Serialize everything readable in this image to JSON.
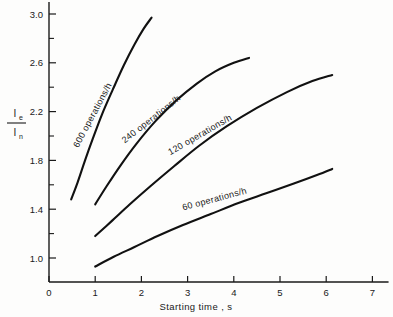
{
  "chart_data": {
    "type": "line",
    "title": "",
    "xlabel": "Starting time , s",
    "ylabel_numerator": "I",
    "ylabel_numerator_sub": "e",
    "ylabel_denominator": "I",
    "ylabel_denominator_sub": "n",
    "xlim": [
      0,
      7.35
    ],
    "ylim": [
      0.8,
      3.05
    ],
    "xticks": [
      "0",
      "1",
      "2",
      "3",
      "4",
      "5",
      "6",
      "7"
    ],
    "xtick_values": [
      0,
      1,
      2,
      3,
      4,
      5,
      6,
      7
    ],
    "yticks": [
      "1.0",
      "1.4",
      "1.8",
      "2.2",
      "2.6",
      "3.0"
    ],
    "ytick_values": [
      1.0,
      1.4,
      1.8,
      2.2,
      2.6,
      3.0
    ],
    "yminor_values": [
      1.2,
      1.6,
      2.0,
      2.4,
      2.8
    ],
    "grid": false,
    "legend_position": "inline-curve-labels",
    "series": [
      {
        "name": "600 operations/h",
        "label": "600 operations/h",
        "label_x": 1.0,
        "label_y": 2.16,
        "label_rotation": -62,
        "points": [
          [
            0.48,
            1.48
          ],
          [
            0.62,
            1.62
          ],
          [
            0.78,
            1.8
          ],
          [
            0.95,
            1.98
          ],
          [
            1.15,
            2.18
          ],
          [
            1.38,
            2.38
          ],
          [
            1.62,
            2.58
          ],
          [
            1.85,
            2.75
          ],
          [
            2.05,
            2.88
          ],
          [
            2.22,
            2.97
          ]
        ]
      },
      {
        "name": "240 operations/h",
        "label": "240 operations/h",
        "label_x": 2.25,
        "label_y": 2.12,
        "label_rotation": -38,
        "points": [
          [
            1.0,
            1.44
          ],
          [
            1.25,
            1.59
          ],
          [
            1.55,
            1.76
          ],
          [
            1.9,
            1.94
          ],
          [
            2.3,
            2.12
          ],
          [
            2.75,
            2.29
          ],
          [
            3.2,
            2.43
          ],
          [
            3.6,
            2.53
          ],
          [
            4.0,
            2.6
          ],
          [
            4.33,
            2.64
          ]
        ]
      },
      {
        "name": "120 operations/h",
        "label": "120 operations/h",
        "label_x": 3.3,
        "label_y": 1.99,
        "label_rotation": -30,
        "points": [
          [
            1.0,
            1.18
          ],
          [
            1.35,
            1.3
          ],
          [
            1.75,
            1.44
          ],
          [
            2.2,
            1.59
          ],
          [
            2.7,
            1.75
          ],
          [
            3.25,
            1.92
          ],
          [
            3.85,
            2.08
          ],
          [
            4.5,
            2.23
          ],
          [
            5.15,
            2.36
          ],
          [
            5.7,
            2.45
          ],
          [
            6.13,
            2.5
          ]
        ]
      },
      {
        "name": "60 operations/h",
        "label": "60 operations/h",
        "label_x": 3.6,
        "label_y": 1.46,
        "label_rotation": -15,
        "points": [
          [
            1.0,
            0.93
          ],
          [
            1.4,
            1.01
          ],
          [
            1.85,
            1.09
          ],
          [
            2.35,
            1.18
          ],
          [
            2.9,
            1.27
          ],
          [
            3.5,
            1.36
          ],
          [
            4.1,
            1.45
          ],
          [
            4.7,
            1.53
          ],
          [
            5.3,
            1.61
          ],
          [
            5.8,
            1.68
          ],
          [
            6.13,
            1.73
          ]
        ]
      }
    ]
  }
}
